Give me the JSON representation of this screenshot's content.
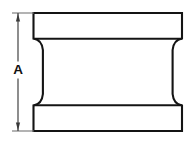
{
  "drawing": {
    "title": "Spool / I-beam profile cross-section",
    "background_color": "#ffffff",
    "line_color": "#141414",
    "dimension_color": "#3a3a3a",
    "extension_color": "#6e6e6e",
    "canvas": {
      "width": 194,
      "height": 145
    }
  },
  "dimension": {
    "label": "A",
    "label_x": 18,
    "label_y": 70,
    "line_x": 18,
    "line_top_y": 13,
    "line_bottom_y": 131,
    "arrow_size": 4.2,
    "extension_lines": [
      {
        "name": "top-extension-line",
        "x1": 12,
        "x2": 34,
        "y": 13
      },
      {
        "name": "bottom-extension-line",
        "x1": 12,
        "x2": 34,
        "y": 131
      }
    ]
  },
  "part": {
    "name": "spool-body",
    "outline_path": "M 33.5 13 L 182 13 L 182 38.5 C 176 39.5 173.2 43.5 172.6 50 L 172.6 94 C 173.2 100.5 176 104.5 182 105.5 L 182 131 L 33.5 131 L 33.5 105.5 C 39.5 104.5 42.3 100.5 42.9 94 L 42.9 50 C 42.3 43.5 39.5 39.5 33.5 38.5 Z",
    "flange_dividers": [
      {
        "name": "upper-flange-divider",
        "x1": 33.5,
        "x2": 182,
        "y": 38.8
      },
      {
        "name": "lower-flange-divider",
        "x1": 33.5,
        "x2": 182,
        "y": 105.2
      }
    ],
    "geometry_notes": {
      "overall_left_x": 33.5,
      "overall_right_x": 182,
      "overall_top_y": 13,
      "overall_bottom_y": 131,
      "waist_left_x": 42.9,
      "waist_right_x": 172.6,
      "upper_flange_bottom_y": 38.8,
      "lower_flange_top_y": 105.2
    }
  }
}
